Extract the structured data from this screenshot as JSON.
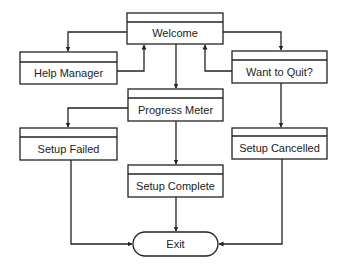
{
  "diagram": {
    "type": "flowchart",
    "nodes": [
      {
        "id": "welcome",
        "label": "Welcome",
        "shape": "state-box"
      },
      {
        "id": "help",
        "label": "Help Manager",
        "shape": "state-box"
      },
      {
        "id": "quit",
        "label": "Want to Quit?",
        "shape": "state-box"
      },
      {
        "id": "progress",
        "label": "Progress Meter",
        "shape": "state-box"
      },
      {
        "id": "failed",
        "label": "Setup Failed",
        "shape": "state-box"
      },
      {
        "id": "cancelled",
        "label": "Setup Cancelled",
        "shape": "state-box"
      },
      {
        "id": "complete",
        "label": "Setup Complete",
        "shape": "state-box"
      },
      {
        "id": "exit",
        "label": "Exit",
        "shape": "terminator"
      }
    ],
    "edges": [
      {
        "from": "welcome",
        "to": "help"
      },
      {
        "from": "help",
        "to": "welcome"
      },
      {
        "from": "welcome",
        "to": "quit"
      },
      {
        "from": "quit",
        "to": "welcome"
      },
      {
        "from": "welcome",
        "to": "progress"
      },
      {
        "from": "progress",
        "to": "failed"
      },
      {
        "from": "progress",
        "to": "complete"
      },
      {
        "from": "quit",
        "to": "cancelled"
      },
      {
        "from": "failed",
        "to": "exit"
      },
      {
        "from": "complete",
        "to": "exit"
      },
      {
        "from": "cancelled",
        "to": "exit"
      }
    ],
    "colors": {
      "stroke": "#222222",
      "background": "#ffffff",
      "text": "#222222"
    }
  }
}
